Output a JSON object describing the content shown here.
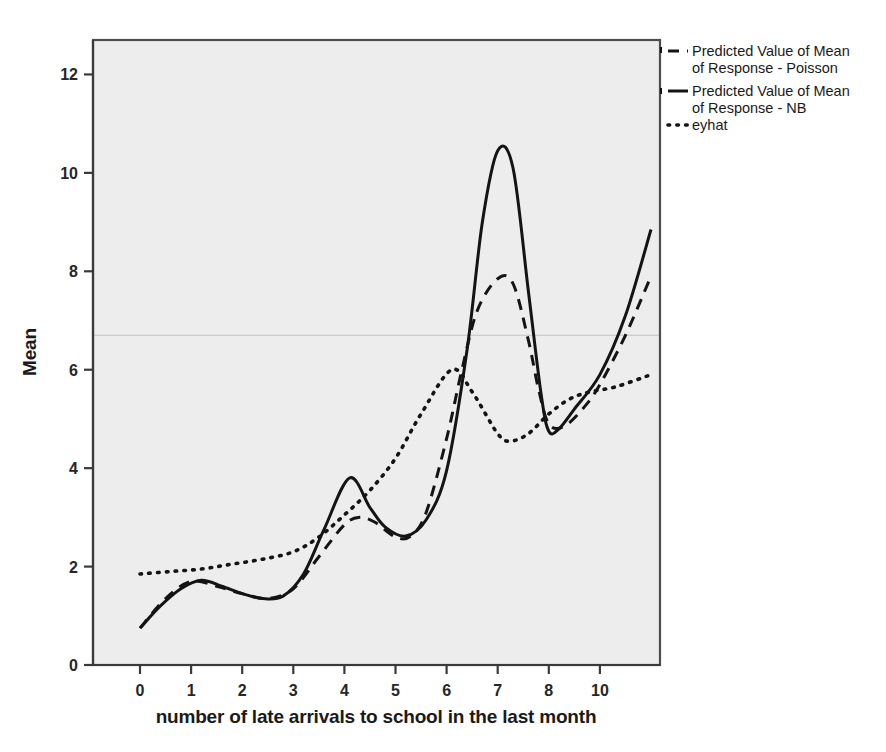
{
  "chart_data": {
    "type": "line",
    "title": "",
    "subtitle": "",
    "xlabel": "number of late arrivals to school in the last month",
    "ylabel": "Mean",
    "xlim": [
      0,
      10
    ],
    "ylim": [
      0,
      12.7
    ],
    "x_tick_labels": [
      "0",
      "1",
      "2",
      "3",
      "4",
      "5",
      "6",
      "7",
      "8",
      "10"
    ],
    "x_tick_values": [
      0,
      1,
      2,
      3,
      4,
      5,
      6,
      7,
      8,
      9
    ],
    "y_tick_labels": [
      "0",
      "2",
      "4",
      "6",
      "8",
      "10",
      "12"
    ],
    "y_tick_values": [
      0,
      2,
      4,
      6,
      8,
      10,
      12
    ],
    "grid": "single faint horizontal line at y=6.7",
    "gridline_y": 6.7,
    "legend_position": "outside-right-top",
    "series": [
      {
        "name": "Predicted Value of Mean of Response - Poisson",
        "style": "dashed",
        "color": "#141414",
        "x": [
          0,
          0.5,
          1,
          1.5,
          2,
          2.5,
          3,
          3.5,
          4,
          4.3,
          4.6,
          5,
          5.3,
          5.6,
          6,
          6.3,
          6.6,
          7,
          7.3,
          7.6,
          7.8,
          8,
          8.3,
          8.7,
          9,
          9.5,
          10
        ],
        "y": [
          0.75,
          1.35,
          1.7,
          1.6,
          1.45,
          1.35,
          1.55,
          2.2,
          2.85,
          3.0,
          2.9,
          2.6,
          2.62,
          3.1,
          4.6,
          6.0,
          7.2,
          7.85,
          7.75,
          6.6,
          5.6,
          4.9,
          4.85,
          5.25,
          5.7,
          6.7,
          7.9
        ]
      },
      {
        "name": "Predicted Value of Mean of Response - NB",
        "style": "solid",
        "color": "#141414",
        "x": [
          0,
          0.4,
          0.8,
          1.2,
          1.6,
          2,
          2.4,
          2.8,
          3.2,
          3.6,
          4.1,
          4.5,
          4.8,
          5.2,
          5.6,
          6,
          6.4,
          6.7,
          7,
          7.3,
          7.6,
          7.85,
          8,
          8.2,
          8.5,
          9,
          9.5,
          10
        ],
        "y": [
          0.75,
          1.2,
          1.55,
          1.72,
          1.6,
          1.45,
          1.35,
          1.4,
          1.85,
          2.75,
          3.8,
          3.2,
          2.8,
          2.62,
          2.95,
          3.95,
          6.4,
          9.0,
          10.45,
          10.1,
          7.6,
          5.5,
          4.75,
          4.8,
          5.2,
          5.9,
          7.1,
          8.85
        ]
      },
      {
        "name": "eyhat",
        "style": "dotted",
        "color": "#141414",
        "x": [
          0,
          0.6,
          1.2,
          1.8,
          2.4,
          3,
          3.5,
          4,
          4.5,
          5,
          5.5,
          6.1,
          6.5,
          7,
          7.25,
          7.6,
          8,
          8.4,
          8.8,
          9.3,
          10
        ],
        "y": [
          1.85,
          1.9,
          1.95,
          2.05,
          2.15,
          2.3,
          2.6,
          3.05,
          3.55,
          4.2,
          5.1,
          6.0,
          5.55,
          4.7,
          4.55,
          4.7,
          5.1,
          5.4,
          5.55,
          5.65,
          5.9
        ]
      }
    ]
  },
  "legend": {
    "entries": [
      {
        "line1": "Predicted Value of Mean",
        "line2": "of Response - Poisson",
        "style": "dashed"
      },
      {
        "line1": "Predicted Value of Mean",
        "line2": "of Response - NB",
        "style": "solid"
      },
      {
        "line1": "eyhat",
        "line2": "",
        "style": "dotted"
      }
    ]
  },
  "axes": {
    "y_title": "Mean",
    "x_title": "number of late arrivals to school in the last month"
  },
  "colors": {
    "plot_background": "#ededed",
    "page_background": "#ffffff",
    "line": "#141414",
    "frame": "#4d4d4d",
    "gridline": "#c3c3c3",
    "text": "#1a1a1a"
  }
}
